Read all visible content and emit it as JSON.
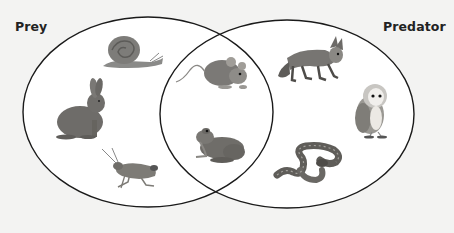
{
  "diagram": {
    "type": "venn",
    "sets": [
      {
        "id": "prey",
        "label": "Prey"
      },
      {
        "id": "predator",
        "label": "Predator"
      }
    ],
    "regions": {
      "prey_only": [
        "snail",
        "rabbit",
        "grasshopper"
      ],
      "both": [
        "mouse",
        "frog"
      ],
      "predator_only": [
        "fox",
        "owl",
        "snake"
      ]
    }
  },
  "labels": {
    "prey": "Prey",
    "predator": "Predator"
  },
  "animals": [
    {
      "name": "snail",
      "region": "prey"
    },
    {
      "name": "rabbit",
      "region": "prey"
    },
    {
      "name": "grasshopper",
      "region": "prey"
    },
    {
      "name": "mouse",
      "region": "both"
    },
    {
      "name": "frog",
      "region": "both"
    },
    {
      "name": "fox",
      "region": "predator"
    },
    {
      "name": "owl",
      "region": "predator"
    },
    {
      "name": "snake",
      "region": "predator"
    }
  ],
  "colors": {
    "background": "#f3f3f2",
    "set_fill": "#ffffff",
    "outline": "#1a1a1a",
    "label": "#222222"
  }
}
